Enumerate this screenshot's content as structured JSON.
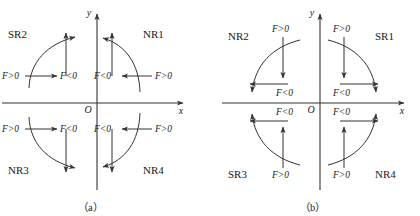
{
  "figure": {
    "caption_a": "（a）",
    "caption_b": "（b）",
    "axis_x_label": "x",
    "axis_y_label": "y",
    "origin_label": "O",
    "force_positive": "F>0",
    "force_negative": "F<0",
    "stroke_color": "#333333",
    "text_color": "#1a1a1a",
    "background": "#ffffff"
  },
  "diagram_a": {
    "name": "(a)",
    "quadrants": [
      {
        "key": "q1",
        "label": "NR1",
        "position": "upper-right",
        "radial_inward_label": "F<0",
        "radial_outward_label": "F>0",
        "tangential_direction": "counterclockwise"
      },
      {
        "key": "q2",
        "label": "SR2",
        "position": "upper-left",
        "radial_inward_label": "F<0",
        "radial_outward_label": "F>0",
        "tangential_direction": "counterclockwise"
      },
      {
        "key": "q3",
        "label": "NR3",
        "position": "lower-left",
        "radial_inward_label": "F<0",
        "radial_outward_label": "F>0",
        "tangential_direction": "clockwise"
      },
      {
        "key": "q4",
        "label": "NR4",
        "position": "lower-right",
        "radial_inward_label": "F<0",
        "radial_outward_label": "F>0",
        "tangential_direction": "clockwise"
      }
    ]
  },
  "diagram_b": {
    "name": "(b)",
    "quadrants": [
      {
        "key": "q1",
        "label": "SR1",
        "position": "upper-right",
        "vertical_label": "F>0",
        "horizontal_label": "F<0",
        "tangential_direction": "clockwise"
      },
      {
        "key": "q2",
        "label": "NR2",
        "position": "upper-left",
        "vertical_label": "F>0",
        "horizontal_label": "F<0",
        "tangential_direction": "clockwise"
      },
      {
        "key": "q3",
        "label": "SR3",
        "position": "lower-left",
        "vertical_label": "F>0",
        "horizontal_label": "F<0",
        "tangential_direction": "counterclockwise"
      },
      {
        "key": "q4",
        "label": "NR4",
        "position": "lower-right",
        "vertical_label": "F>0",
        "horizontal_label": "F<0",
        "tangential_direction": "counterclockwise"
      }
    ]
  }
}
